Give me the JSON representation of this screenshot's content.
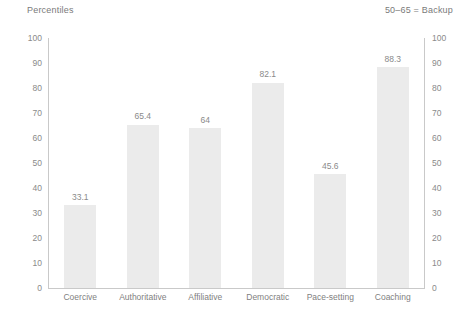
{
  "header": {
    "title": "Percentiles",
    "note": "50–65 = Backup"
  },
  "axis": {
    "ticks": [
      "100",
      "90",
      "80",
      "70",
      "60",
      "50",
      "40",
      "30",
      "20",
      "10",
      "0"
    ]
  },
  "colors": {
    "bar": "#ebebeb",
    "axis": "#c9c9c9",
    "text": "#7f7f7f"
  },
  "chart_data": {
    "type": "bar",
    "title": "Percentiles",
    "xlabel": "",
    "ylabel": "Percentiles",
    "ylim": [
      0,
      100
    ],
    "grid": false,
    "legend": "none",
    "annotations": [
      "50–65 = Backup"
    ],
    "dual_axis": true,
    "categories": [
      "Coercive",
      "Authoritative",
      "Affiliative",
      "Democratic",
      "Pace-setting",
      "Coaching"
    ],
    "values": [
      33.1,
      65.4,
      64,
      82.1,
      45.6,
      88.3
    ],
    "value_labels": [
      "33.1",
      "65.4",
      "64",
      "82.1",
      "45.6",
      "88.3"
    ],
    "ticks": [
      0,
      10,
      20,
      30,
      40,
      50,
      60,
      70,
      80,
      90,
      100
    ]
  }
}
